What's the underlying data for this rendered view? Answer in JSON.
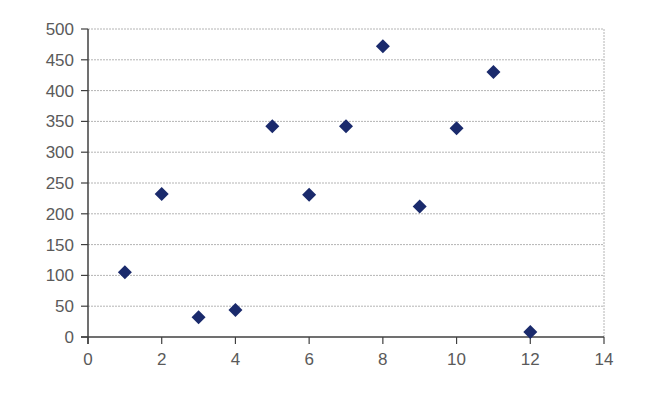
{
  "chart_data": {
    "type": "scatter",
    "title": "",
    "xlabel": "",
    "ylabel": "",
    "xlim": [
      0,
      14
    ],
    "ylim": [
      0,
      500
    ],
    "x_ticks": [
      0,
      2,
      4,
      6,
      8,
      10,
      12,
      14
    ],
    "y_ticks": [
      0,
      50,
      100,
      150,
      200,
      250,
      300,
      350,
      400,
      450,
      500
    ],
    "grid": "horizontal",
    "legend": "none",
    "marker": "diamond",
    "marker_color": "#1a2a6c",
    "series": [
      {
        "name": "Series1",
        "points": [
          {
            "x": 1,
            "y": 105
          },
          {
            "x": 2,
            "y": 232
          },
          {
            "x": 3,
            "y": 32
          },
          {
            "x": 4,
            "y": 44
          },
          {
            "x": 5,
            "y": 342
          },
          {
            "x": 6,
            "y": 231
          },
          {
            "x": 7,
            "y": 342
          },
          {
            "x": 8,
            "y": 472
          },
          {
            "x": 9,
            "y": 212
          },
          {
            "x": 10,
            "y": 339
          },
          {
            "x": 11,
            "y": 430
          },
          {
            "x": 12,
            "y": 8
          }
        ]
      }
    ]
  }
}
